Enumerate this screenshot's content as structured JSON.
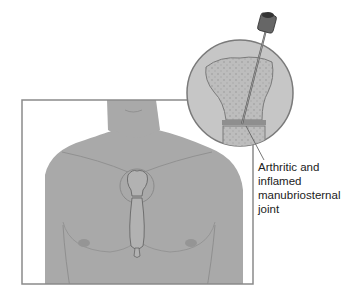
{
  "figure": {
    "annotation": {
      "lines": [
        "Arthritic and",
        "inflamed",
        "manubriosternal",
        "joint"
      ]
    },
    "colors": {
      "skin": "#a9a9a9",
      "outline": "#7a7a7a",
      "bone": "#c4c4c4",
      "marrow": "#b5b5b5",
      "frame": "#8a8a8a",
      "needle": "#555555"
    }
  }
}
